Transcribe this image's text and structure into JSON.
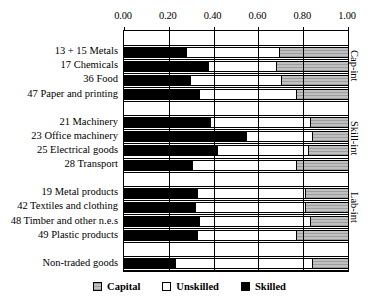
{
  "chart_data": {
    "type": "bar",
    "orientation": "horizontal",
    "stacked": true,
    "title": "",
    "xlabel": "",
    "ylabel": "",
    "xlim": [
      0.0,
      1.0
    ],
    "grid": true,
    "legend_position": "bottom",
    "tick_labels": [
      "0.00",
      "0.20",
      "0.40",
      "0.60",
      "0.80",
      "1.00"
    ],
    "tick_values": [
      0.0,
      0.2,
      0.4,
      0.6,
      0.8,
      1.0
    ],
    "series": [
      {
        "name": "Skilled",
        "color": "#000000",
        "values": [
          0.28,
          0.38,
          0.3,
          0.34,
          0.39,
          0.55,
          0.42,
          0.31,
          0.33,
          0.32,
          0.34,
          0.33,
          0.23
        ]
      },
      {
        "name": "Unskilled",
        "color": "#ffffff",
        "values": [
          0.41,
          0.3,
          0.4,
          0.43,
          0.44,
          0.29,
          0.4,
          0.46,
          0.48,
          0.49,
          0.49,
          0.44,
          0.61
        ]
      },
      {
        "name": "Capital",
        "color": "#c0c0c0",
        "values": [
          0.31,
          0.32,
          0.3,
          0.23,
          0.17,
          0.16,
          0.18,
          0.23,
          0.19,
          0.19,
          0.17,
          0.23,
          0.16
        ]
      }
    ],
    "categories": [
      "13 + 15 Metals",
      "17 Chemicals",
      "36 Food",
      "47 Paper and printing",
      "21 Machinery",
      "23 Office machinery",
      "25 Electrical goods",
      "28 Transport",
      "19 Metal products",
      "42 Textiles and clothing",
      "48 Timber and other n.e.s",
      "49 Plastic products",
      "Non-traded goods"
    ],
    "groups": [
      {
        "label": "Cap-int",
        "categories": [
          "13 + 15 Metals",
          "17 Chemicals",
          "36 Food",
          "47 Paper and printing"
        ]
      },
      {
        "label": "Skill-int",
        "categories": [
          "21 Machinery",
          "23 Office machinery",
          "25 Electrical goods",
          "28 Transport"
        ]
      },
      {
        "label": "Lab-int",
        "categories": [
          "19 Metal products",
          "42 Textiles and clothing",
          "48 Timber and other n.e.s",
          "49 Plastic products"
        ]
      },
      {
        "label": "",
        "categories": [
          "Non-traded goods"
        ]
      }
    ],
    "bars": [
      {
        "category": "13 + 15 Metals",
        "group": "Cap-int",
        "skilled": 0.28,
        "unskilled": 0.41,
        "capital": 0.31
      },
      {
        "category": "17 Chemicals",
        "group": "Cap-int",
        "skilled": 0.38,
        "unskilled": 0.3,
        "capital": 0.32
      },
      {
        "category": "36 Food",
        "group": "Cap-int",
        "skilled": 0.3,
        "unskilled": 0.4,
        "capital": 0.3
      },
      {
        "category": "47 Paper and printing",
        "group": "Cap-int",
        "skilled": 0.34,
        "unskilled": 0.43,
        "capital": 0.23
      },
      {
        "category": "21 Machinery",
        "group": "Skill-int",
        "skilled": 0.39,
        "unskilled": 0.44,
        "capital": 0.17
      },
      {
        "category": "23 Office machinery",
        "group": "Skill-int",
        "skilled": 0.55,
        "unskilled": 0.29,
        "capital": 0.16
      },
      {
        "category": "25 Electrical goods",
        "group": "Skill-int",
        "skilled": 0.42,
        "unskilled": 0.4,
        "capital": 0.18
      },
      {
        "category": "28 Transport",
        "group": "Skill-int",
        "skilled": 0.31,
        "unskilled": 0.46,
        "capital": 0.23
      },
      {
        "category": "19 Metal products",
        "group": "Lab-int",
        "skilled": 0.33,
        "unskilled": 0.48,
        "capital": 0.19
      },
      {
        "category": "42 Textiles and clothing",
        "group": "Lab-int",
        "skilled": 0.32,
        "unskilled": 0.49,
        "capital": 0.19
      },
      {
        "category": "48 Timber and other n.e.s",
        "group": "Lab-int",
        "skilled": 0.34,
        "unskilled": 0.49,
        "capital": 0.17
      },
      {
        "category": "49 Plastic products",
        "group": "Lab-int",
        "skilled": 0.33,
        "unskilled": 0.44,
        "capital": 0.23
      },
      {
        "category": "Non-traded goods",
        "group": "",
        "skilled": 0.23,
        "unskilled": 0.61,
        "capital": 0.16
      }
    ],
    "legend": [
      {
        "label": "Capital",
        "color": "#c0c0c0"
      },
      {
        "label": "Unskilled",
        "color": "#ffffff"
      },
      {
        "label": "Skilled",
        "color": "#000000"
      }
    ]
  }
}
